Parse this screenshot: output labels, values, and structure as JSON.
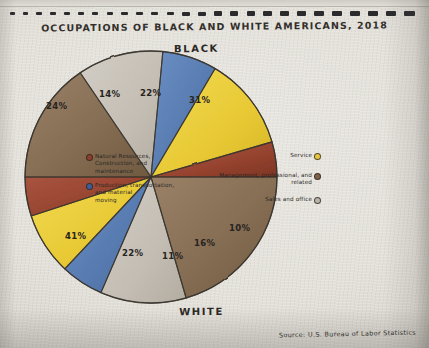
{
  "notebook": {
    "binding_hole_count": 26
  },
  "title": "OCCUPATIONS OF BLACK AND WHITE AMERICANS, 2018",
  "source_note": "Source: U.S. Bureau of Labor Statistics",
  "half_labels": {
    "top": "BLACK",
    "bottom": "WHITE"
  },
  "legend": {
    "left": [
      {
        "label": "Natural Resources,\nConstruction, and\nmaintenance",
        "color": "#8d3f2e"
      },
      {
        "label": "Production, transportation,\nand material\nmoving",
        "color": "#3f5f96"
      }
    ],
    "right": [
      {
        "label": "Service",
        "color": "#e8c53c"
      },
      {
        "label": "Management, professional, and\nrelated",
        "color": "#7d6148"
      },
      {
        "label": "Sales and office",
        "color": "#b9b2a8"
      }
    ]
  },
  "colors": {
    "management": "#8a7158",
    "sales_office": "#c9c3bb",
    "production": "#5b80b6",
    "service": "#e8cb3e",
    "natural_resources": "#9a4532",
    "outline": "#3a352f",
    "paper": "#e2dfd8",
    "ink": "#2e2b28"
  },
  "chart_data": {
    "type": "pie",
    "title": "OCCUPATIONS OF BLACK AND WHITE AMERICANS, 2018",
    "subtitle": "",
    "xlabel": "",
    "ylabel": "",
    "units": "percent",
    "legend_position": "sides",
    "grid": false,
    "note": "Double half-pie: upper semicircle = Black workers, lower semicircle = White workers. Each half sums to 100%.",
    "categories": [
      "Management, professional, and related",
      "Sales and office",
      "Production, transportation, and material moving",
      "Service",
      "Natural Resources, Construction, and maintenance"
    ],
    "category_colors": [
      "#8a7158",
      "#c9c3bb",
      "#5b80b6",
      "#e8cb3e",
      "#9a4532"
    ],
    "series": [
      {
        "name": "BLACK",
        "half": "top",
        "values": [
          31,
          22,
          14,
          24,
          9
        ],
        "labels": [
          "31%",
          "22%",
          "14%",
          "24%",
          ""
        ]
      },
      {
        "name": "WHITE",
        "half": "bottom",
        "values": [
          41,
          22,
          11,
          16,
          10
        ],
        "labels": [
          "41%",
          "22%",
          "11%",
          "16%",
          "10%"
        ]
      }
    ]
  },
  "slice_labels": {
    "black_management": "31%",
    "black_sales": "22%",
    "black_production": "14%",
    "black_service": "24%",
    "white_management": "41%",
    "white_sales": "22%",
    "white_production": "11%",
    "white_service": "16%",
    "white_natural": "10%"
  }
}
